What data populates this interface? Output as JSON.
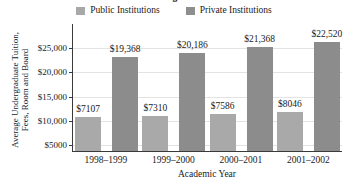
{
  "chart_data": {
    "type": "bar",
    "title": "The Cost of Higher Education",
    "xlabel": "Academic Year",
    "ylabel": "Average Undergraduate Tuition, Fees, Room and Board",
    "categories": [
      "1998–1999",
      "1999–2000",
      "2000–2001",
      "2001–2002"
    ],
    "series": [
      {
        "name": "Public Institutions",
        "color": "#a9a9a9",
        "values": [
          7107,
          7310,
          7586,
          8046
        ],
        "labels": [
          "$7107",
          "$7310",
          "$7586",
          "$8046"
        ]
      },
      {
        "name": "Private Institutions",
        "color": "#8c8c8c",
        "values": [
          19368,
          20186,
          21368,
          22520
        ],
        "labels": [
          "$19,368",
          "$20,186",
          "$21,368",
          "$22,520"
        ]
      }
    ],
    "ylim": [
      0,
      26400
    ],
    "yticks": [
      5000,
      10000,
      15000,
      20000,
      25000
    ],
    "ytick_labels": [
      "$5000",
      "$10,000",
      "$15,000",
      "$20,000",
      "$25,000"
    ],
    "grid": true,
    "legend_position": "top"
  }
}
